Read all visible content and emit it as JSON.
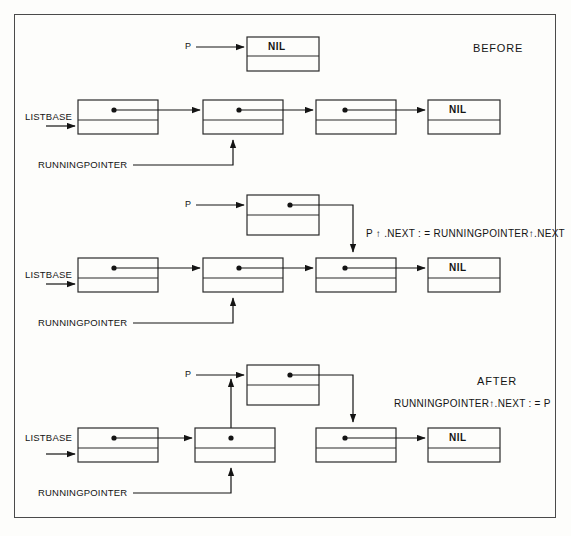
{
  "figure": {
    "title_before": "BEFORE",
    "title_after": "AFTER",
    "formula_middle": "P ↑ .NEXT : = RUNNINGPOINTER↑.NEXT",
    "formula_after": "RUNNINGPOINTER↑.NEXT : = P",
    "label_listbase": "LISTBASE",
    "label_runningpointer": "RUNNINGPOINTER",
    "label_p": "P",
    "label_nil": "NIL",
    "colors": {
      "ink": "#141414",
      "frame": "#4a4a4a",
      "paper": "#fdfdfb",
      "node_stroke": "#2a2a2a"
    }
  },
  "diagrams": [
    {
      "name": "before",
      "caption": "BEFORE",
      "new_node": {
        "label": "NIL",
        "pointer_label": "P",
        "has_data": false
      },
      "list": {
        "base_label": "LISTBASE",
        "nodes": [
          {
            "label": "",
            "has_dot": true
          },
          {
            "label": "",
            "has_dot": true
          },
          {
            "label": "",
            "has_dot": true
          },
          {
            "label": "NIL",
            "has_dot": false
          }
        ],
        "running_pointer_label": "RUNNINGPOINTER",
        "running_pointer_target_index": 1
      },
      "formula": ""
    },
    {
      "name": "middle",
      "caption": "",
      "new_node": {
        "label": "",
        "pointer_label": "P",
        "has_data": true
      },
      "list": {
        "base_label": "LISTBASE",
        "nodes": [
          {
            "label": "",
            "has_dot": true
          },
          {
            "label": "",
            "has_dot": true
          },
          {
            "label": "",
            "has_dot": true
          },
          {
            "label": "NIL",
            "has_dot": false
          }
        ],
        "running_pointer_label": "RUNNINGPOINTER",
        "running_pointer_target_index": 1
      },
      "formula": "P ↑ .NEXT : = RUNNINGPOINTER↑.NEXT"
    },
    {
      "name": "after",
      "caption": "AFTER",
      "new_node": {
        "label": "",
        "pointer_label": "P",
        "has_data": true
      },
      "list": {
        "base_label": "LISTBASE",
        "nodes": [
          {
            "label": "",
            "has_dot": true
          },
          {
            "label": "",
            "has_dot": true
          },
          {
            "label": "",
            "has_dot": true
          },
          {
            "label": "NIL",
            "has_dot": false
          }
        ],
        "running_pointer_label": "RUNNINGPOINTER",
        "running_pointer_target_index": 1
      },
      "formula": "RUNNINGPOINTER↑.NEXT : = P"
    }
  ]
}
